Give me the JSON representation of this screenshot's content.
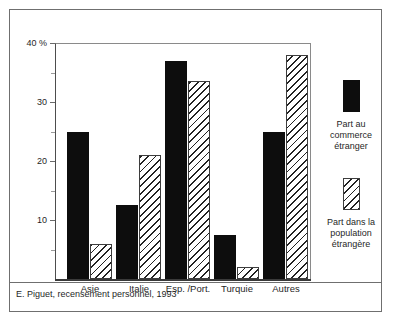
{
  "chart_data": {
    "type": "bar",
    "title": "",
    "xlabel": "",
    "ylabel": "",
    "y_unit": "%",
    "ylim": [
      0,
      40
    ],
    "yticks": [
      0,
      10,
      20,
      30,
      40
    ],
    "ytick_labels": [
      "",
      "10",
      "20",
      "30",
      "40 %"
    ],
    "yticks_minor": [
      5,
      15,
      25,
      35
    ],
    "grid": false,
    "legend_position": "right",
    "categories": [
      "Asie",
      "Italie",
      "Esp. /Port.",
      "Turquie",
      "Autres"
    ],
    "series": [
      {
        "name": "Part au commerce étranger",
        "fill": "solid-black",
        "values": [
          25,
          12.5,
          37,
          7.5,
          25
        ]
      },
      {
        "name": "Part dans la population étrangère",
        "fill": "diagonal-hatch",
        "values": [
          6,
          21,
          33.5,
          2,
          38
        ]
      }
    ],
    "source": "E. Piguet, recensement personnel, 1993"
  },
  "axis": {
    "y_labels": [
      {
        "value": 40,
        "text": "40 %"
      },
      {
        "value": 30,
        "text": "30"
      },
      {
        "value": 20,
        "text": "20"
      },
      {
        "value": 10,
        "text": "10"
      }
    ]
  },
  "legend": {
    "entries": [
      {
        "label_line1": "Part au",
        "label_line2": "commerce",
        "label_line3": "étranger"
      },
      {
        "label_line1": "Part dans la",
        "label_line2": "population",
        "label_line3": "étrangère"
      }
    ]
  },
  "caption": {
    "text": "E. Piguet, recensement personnel, 1993"
  },
  "top_cut_text": {
    "text": ""
  }
}
